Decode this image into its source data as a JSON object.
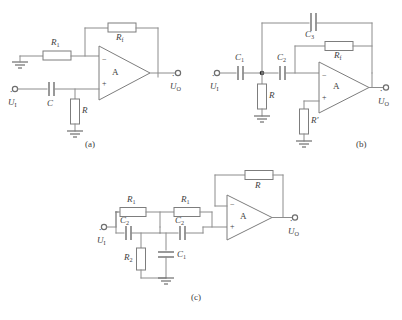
{
  "figure": {
    "title": "",
    "background_color": "#ffffff",
    "wire_color": "#8c8c8c",
    "text_color": "#3d3d3d",
    "subfigures": [
      {
        "caption": "(a)",
        "name": "circuit-a",
        "input_terminal": "U",
        "input_subscript": "I",
        "output_terminal": "U",
        "output_subscript": "O",
        "amp_label": "A",
        "amp_inverting": "−",
        "amp_noninverting": "+",
        "components": [
          {
            "type": "resistor",
            "label": "R",
            "sub": "1"
          },
          {
            "type": "resistor",
            "label": "R",
            "sub": "f"
          },
          {
            "type": "capacitor",
            "label": "C",
            "sub": ""
          },
          {
            "type": "resistor",
            "label": "R",
            "sub": ""
          }
        ]
      },
      {
        "caption": "(b)",
        "name": "circuit-b",
        "input_terminal": "U",
        "input_subscript": "I",
        "output_terminal": "U",
        "output_subscript": "O",
        "amp_label": "A",
        "amp_inverting": "−",
        "amp_noninverting": "+",
        "components": [
          {
            "type": "capacitor",
            "label": "C",
            "sub": "1"
          },
          {
            "type": "capacitor",
            "label": "C",
            "sub": "2"
          },
          {
            "type": "capacitor",
            "label": "C",
            "sub": "3"
          },
          {
            "type": "resistor",
            "label": "R",
            "sub": "f"
          },
          {
            "type": "resistor",
            "label": "R",
            "sub": ""
          },
          {
            "type": "resistor",
            "label": "R′",
            "sub": ""
          }
        ]
      },
      {
        "caption": "(c)",
        "name": "circuit-c",
        "input_terminal": "U",
        "input_subscript": "I",
        "output_terminal": "U",
        "output_subscript": "O",
        "amp_label": "A",
        "amp_inverting": "−",
        "amp_noninverting": "+",
        "components": [
          {
            "type": "resistor",
            "label": "R",
            "sub": "1"
          },
          {
            "type": "resistor",
            "label": "R",
            "sub": "1"
          },
          {
            "type": "capacitor",
            "label": "C",
            "sub": "2"
          },
          {
            "type": "capacitor",
            "label": "C",
            "sub": "2"
          },
          {
            "type": "resistor",
            "label": "R",
            "sub": "2"
          },
          {
            "type": "capacitor",
            "label": "C",
            "sub": "1"
          },
          {
            "type": "resistor",
            "label": "R",
            "sub": ""
          }
        ]
      }
    ]
  },
  "labels": {
    "a": {
      "R1": "R",
      "R1_sub": "1",
      "Rf": "R",
      "Rf_sub": "f",
      "C": "C",
      "R": "R",
      "amp": "A",
      "minus": "−",
      "plus": "+",
      "Ui": "U",
      "Ui_sub": "I",
      "Uo": "U",
      "Uo_sub": "O",
      "caption": "(a)"
    },
    "b": {
      "C1": "C",
      "C1_sub": "1",
      "C2": "C",
      "C2_sub": "2",
      "C3": "C",
      "C3_sub": "3",
      "Rf": "R",
      "Rf_sub": "f",
      "R": "R",
      "Rp": "R′",
      "amp": "A",
      "minus": "−",
      "plus": "+",
      "Ui": "U",
      "Ui_sub": "I",
      "Uo": "U",
      "Uo_sub": "O",
      "caption": "(b)"
    },
    "c": {
      "R1a": "R",
      "R1a_sub": "1",
      "R1b": "R",
      "R1b_sub": "1",
      "C2a": "C",
      "C2a_sub": "2",
      "C2b": "C",
      "C2b_sub": "2",
      "R2": "R",
      "R2_sub": "2",
      "C1": "C",
      "C1_sub": "1",
      "R": "R",
      "amp": "A",
      "minus": "−",
      "plus": "+",
      "Ui": "U",
      "Ui_sub": "I",
      "Uo": "U",
      "Uo_sub": "O",
      "caption": "(c)"
    }
  }
}
